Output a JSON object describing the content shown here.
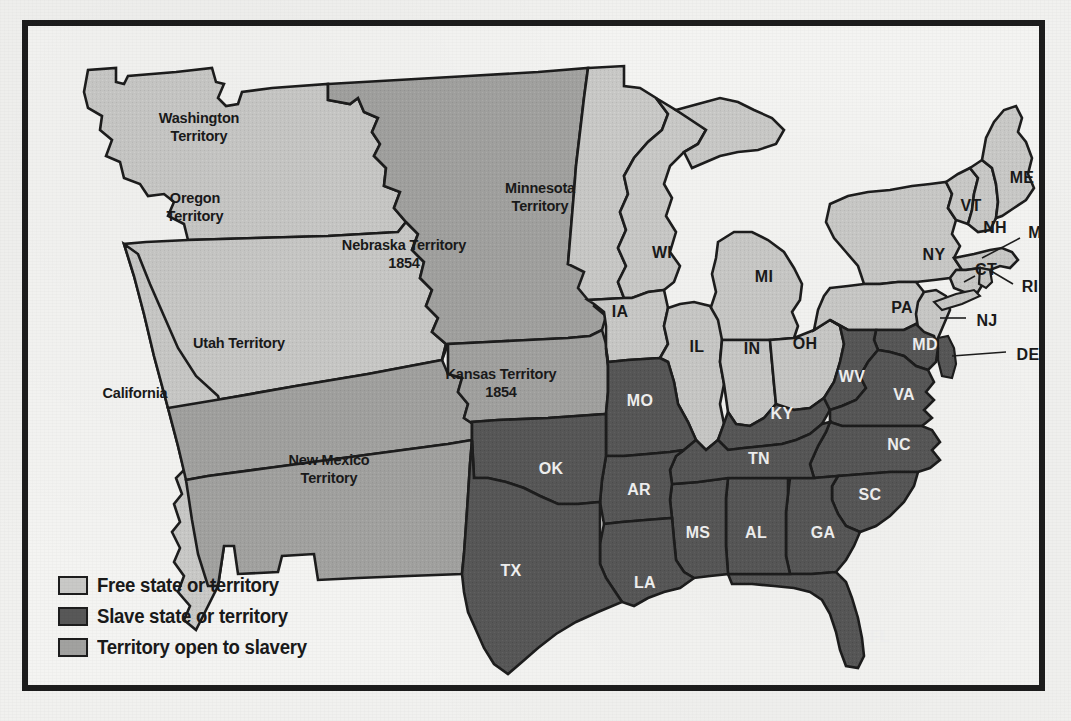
{
  "map": {
    "title": "United States 1854 — Free and Slave States and Territories",
    "colors": {
      "free": "#c9c9c7",
      "slave": "#585858",
      "open": "#a2a2a0",
      "water": "#f4f4f2",
      "outline": "#1d1d1d",
      "paper": "#f1f1ef"
    },
    "legend": {
      "items": [
        {
          "label": "Free state or territory",
          "swatch": "#c9c9c7",
          "key": "free"
        },
        {
          "label": "Slave state or territory",
          "swatch": "#585858",
          "key": "slave"
        },
        {
          "label": "Territory open to slavery",
          "swatch": "#a2a2a0",
          "key": "open"
        }
      ]
    },
    "territories": [
      {
        "id": "washington-territory",
        "name": "Washington\nTerritory",
        "line1": "Washington",
        "line2": "Territory",
        "status": "free",
        "x": 171,
        "y": 102
      },
      {
        "id": "oregon-territory",
        "name": "Oregon\nTerritory",
        "line1": "Oregon",
        "line2": "Territory",
        "status": "free",
        "x": 167,
        "y": 182
      },
      {
        "id": "minnesota-territory",
        "name": "Minnesota\nTerritory",
        "line1": "Minnesota",
        "line2": "Territory",
        "status": "free",
        "x": 512,
        "y": 172
      },
      {
        "id": "nebraska-territory",
        "name": "Nebraska Territory\n1854",
        "line1": "Nebraska Territory",
        "line2": "1854",
        "status": "open",
        "x": 376,
        "y": 229
      },
      {
        "id": "utah-territory",
        "name": "Utah Territory",
        "line1": "Utah Territory",
        "line2": "",
        "status": "open",
        "x": 211,
        "y": 318
      },
      {
        "id": "kansas-territory",
        "name": "Kansas Territory\n1854",
        "line1": "Kansas Territory",
        "line2": "1854",
        "status": "open",
        "x": 473,
        "y": 358
      },
      {
        "id": "new-mexico-territory",
        "name": "New Mexico\nTerritory",
        "line1": "New Mexico",
        "line2": "Territory",
        "status": "open",
        "x": 301,
        "y": 444
      },
      {
        "id": "california",
        "name": "California",
        "line1": "California",
        "line2": "",
        "status": "free",
        "x": 107,
        "y": 368
      }
    ],
    "states": [
      {
        "abbr": "ME",
        "status": "free",
        "x": 994,
        "y": 153
      },
      {
        "abbr": "VT",
        "status": "free",
        "x": 943,
        "y": 181
      },
      {
        "abbr": "NH",
        "status": "free",
        "x": 967,
        "y": 203
      },
      {
        "abbr": "MA",
        "status": "free",
        "x": 1013,
        "y": 208
      },
      {
        "abbr": "NY",
        "status": "free",
        "x": 906,
        "y": 230
      },
      {
        "abbr": "CT",
        "status": "free",
        "x": 958,
        "y": 245
      },
      {
        "abbr": "RI",
        "status": "free",
        "x": 1002,
        "y": 262
      },
      {
        "abbr": "NJ",
        "status": "free",
        "x": 959,
        "y": 296
      },
      {
        "abbr": "PA",
        "status": "free",
        "x": 874,
        "y": 283
      },
      {
        "abbr": "DE",
        "status": "slave",
        "x": 1000,
        "y": 330
      },
      {
        "abbr": "MD",
        "status": "slave",
        "x": 897,
        "y": 320
      },
      {
        "abbr": "WI",
        "status": "free",
        "x": 634,
        "y": 228
      },
      {
        "abbr": "MI",
        "status": "free",
        "x": 736,
        "y": 252
      },
      {
        "abbr": "IA",
        "status": "free",
        "x": 592,
        "y": 287
      },
      {
        "abbr": "IL",
        "status": "free",
        "x": 669,
        "y": 322
      },
      {
        "abbr": "IN",
        "status": "free",
        "x": 724,
        "y": 324
      },
      {
        "abbr": "OH",
        "status": "free",
        "x": 777,
        "y": 319
      },
      {
        "abbr": "WV",
        "status": "slave",
        "x": 824,
        "y": 352
      },
      {
        "abbr": "VA",
        "status": "slave",
        "x": 876,
        "y": 370
      },
      {
        "abbr": "MO",
        "status": "slave",
        "x": 612,
        "y": 376
      },
      {
        "abbr": "KY",
        "status": "slave",
        "x": 754,
        "y": 389
      },
      {
        "abbr": "NC",
        "status": "slave",
        "x": 871,
        "y": 420
      },
      {
        "abbr": "TN",
        "status": "slave",
        "x": 731,
        "y": 434
      },
      {
        "abbr": "OK",
        "status": "slave",
        "x": 523,
        "y": 444
      },
      {
        "abbr": "AR",
        "status": "slave",
        "x": 611,
        "y": 465
      },
      {
        "abbr": "SC",
        "status": "slave",
        "x": 842,
        "y": 470
      },
      {
        "abbr": "MS",
        "status": "slave",
        "x": 670,
        "y": 508
      },
      {
        "abbr": "AL",
        "status": "slave",
        "x": 728,
        "y": 508
      },
      {
        "abbr": "GA",
        "status": "slave",
        "x": 795,
        "y": 508
      },
      {
        "abbr": "LA",
        "status": "slave",
        "x": 617,
        "y": 558
      },
      {
        "abbr": "TX",
        "status": "slave",
        "x": 483,
        "y": 546
      },
      {
        "abbr": "FL",
        "status": "slave",
        "x": 852,
        "y": 612
      }
    ]
  }
}
